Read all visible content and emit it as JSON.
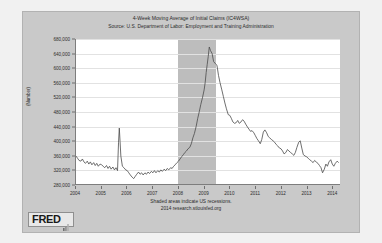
{
  "logo": {
    "text": "FRED",
    "mark_icon": "fred-graph-mark-icon"
  },
  "footer": {
    "line1": "Shaded areas indicate US recessions.",
    "line2": "2014 research.stlouisfed.org"
  },
  "colors": {
    "series_line": "#4a4a4a",
    "recession_band": "#bdbdbd",
    "plot_background": "#ffffff",
    "image_background": "#c9c9c9",
    "gridline": "#e2e2e2",
    "axis": "#7d7d7d",
    "text": "#2b2b2b"
  },
  "chart_data": {
    "type": "line",
    "title": "4-Week Moving Average of Initial Claims (IC4WSA)",
    "subtitle": "Source: U.S. Department of Labor: Employment and Training Administration",
    "xlabel": "",
    "ylabel": "(Number)",
    "ylim": [
      280000,
      680000
    ],
    "xlim": [
      2004.0,
      2014.3
    ],
    "grid": true,
    "legend": "none",
    "ytick_labels": [
      "680,000",
      "640,000",
      "600,000",
      "560,000",
      "520,000",
      "480,000",
      "440,000",
      "400,000",
      "360,000",
      "320,000",
      "280,000"
    ],
    "ytick_values": [
      680000,
      640000,
      600000,
      560000,
      520000,
      480000,
      440000,
      400000,
      360000,
      320000,
      280000
    ],
    "xtick_labels": [
      "2004",
      "2005",
      "2006",
      "2007",
      "2008",
      "2009",
      "2010",
      "2011",
      "2012",
      "2013",
      "2014"
    ],
    "xtick_values": [
      2004,
      2005,
      2006,
      2007,
      2008,
      2009,
      2010,
      2011,
      2012,
      2013,
      2014
    ],
    "annotations": [
      "Shaded areas indicate US recessions."
    ],
    "shaded_regions": [
      {
        "label": "US recession",
        "x_start": 2007.95,
        "x_end": 2009.45
      }
    ],
    "series": [
      {
        "name": "4-Week Moving Average of Initial Claims",
        "x": [
          2004.0,
          2004.06,
          2004.12,
          2004.19,
          2004.25,
          2004.31,
          2004.37,
          2004.44,
          2004.5,
          2004.56,
          2004.62,
          2004.69,
          2004.75,
          2004.81,
          2004.87,
          2004.94,
          2005.0,
          2005.06,
          2005.12,
          2005.19,
          2005.25,
          2005.31,
          2005.37,
          2005.44,
          2005.5,
          2005.56,
          2005.62,
          2005.66,
          2005.69,
          2005.72,
          2005.75,
          2005.81,
          2005.87,
          2005.94,
          2006.0,
          2006.06,
          2006.12,
          2006.19,
          2006.25,
          2006.31,
          2006.37,
          2006.44,
          2006.5,
          2006.56,
          2006.62,
          2006.69,
          2006.75,
          2006.81,
          2006.87,
          2006.94,
          2007.0,
          2007.06,
          2007.12,
          2007.19,
          2007.25,
          2007.31,
          2007.37,
          2007.44,
          2007.5,
          2007.56,
          2007.62,
          2007.69,
          2007.75,
          2007.81,
          2007.87,
          2007.94,
          2008.0,
          2008.06,
          2008.12,
          2008.19,
          2008.25,
          2008.31,
          2008.37,
          2008.44,
          2008.5,
          2008.56,
          2008.62,
          2008.69,
          2008.75,
          2008.81,
          2008.87,
          2008.94,
          2009.0,
          2009.04,
          2009.08,
          2009.12,
          2009.16,
          2009.2,
          2009.25,
          2009.31,
          2009.37,
          2009.44,
          2009.5,
          2009.56,
          2009.62,
          2009.69,
          2009.75,
          2009.81,
          2009.87,
          2009.94,
          2010.0,
          2010.06,
          2010.12,
          2010.19,
          2010.25,
          2010.31,
          2010.37,
          2010.44,
          2010.5,
          2010.56,
          2010.62,
          2010.69,
          2010.75,
          2010.81,
          2010.87,
          2010.94,
          2011.0,
          2011.06,
          2011.12,
          2011.19,
          2011.25,
          2011.31,
          2011.37,
          2011.44,
          2011.5,
          2011.56,
          2011.62,
          2011.69,
          2011.75,
          2011.81,
          2011.87,
          2011.94,
          2012.0,
          2012.06,
          2012.12,
          2012.19,
          2012.25,
          2012.31,
          2012.37,
          2012.44,
          2012.5,
          2012.56,
          2012.62,
          2012.69,
          2012.75,
          2012.81,
          2012.87,
          2012.94,
          2013.0,
          2013.06,
          2013.12,
          2013.19,
          2013.25,
          2013.31,
          2013.37,
          2013.44,
          2013.5,
          2013.56,
          2013.62,
          2013.69,
          2013.75,
          2013.81,
          2013.87,
          2013.94,
          2014.0,
          2014.06,
          2014.12,
          2014.19,
          2014.25
        ],
        "y": [
          358000,
          352000,
          346000,
          344000,
          350000,
          342000,
          338000,
          344000,
          336000,
          342000,
          334000,
          340000,
          332000,
          338000,
          330000,
          336000,
          334000,
          330000,
          326000,
          332000,
          324000,
          330000,
          322000,
          328000,
          320000,
          326000,
          318000,
          396000,
          435000,
          398000,
          358000,
          330000,
          326000,
          320000,
          318000,
          312000,
          306000,
          300000,
          296000,
          302000,
          308000,
          314000,
          308000,
          312000,
          306000,
          312000,
          308000,
          314000,
          310000,
          316000,
          312000,
          318000,
          312000,
          318000,
          314000,
          320000,
          316000,
          322000,
          318000,
          324000,
          320000,
          326000,
          324000,
          330000,
          334000,
          340000,
          344000,
          350000,
          356000,
          362000,
          368000,
          372000,
          378000,
          382000,
          392000,
          408000,
          420000,
          440000,
          462000,
          480000,
          500000,
          520000,
          540000,
          560000,
          588000,
          610000,
          632000,
          658000,
          648000,
          640000,
          618000,
          612000,
          608000,
          580000,
          560000,
          540000,
          522000,
          504000,
          488000,
          472000,
          470000,
          462000,
          452000,
          448000,
          450000,
          456000,
          448000,
          452000,
          458000,
          454000,
          446000,
          438000,
          432000,
          426000,
          428000,
          422000,
          414000,
          406000,
          400000,
          392000,
          404000,
          424000,
          430000,
          422000,
          412000,
          408000,
          404000,
          400000,
          396000,
          390000,
          386000,
          380000,
          378000,
          372000,
          364000,
          368000,
          376000,
          372000,
          368000,
          364000,
          360000,
          368000,
          382000,
          396000,
          400000,
          380000,
          362000,
          358000,
          356000,
          352000,
          348000,
          344000,
          340000,
          346000,
          342000,
          338000,
          332000,
          326000,
          312000,
          322000,
          336000,
          330000,
          342000,
          348000,
          336000,
          330000,
          338000,
          344000,
          340000
        ]
      }
    ]
  }
}
